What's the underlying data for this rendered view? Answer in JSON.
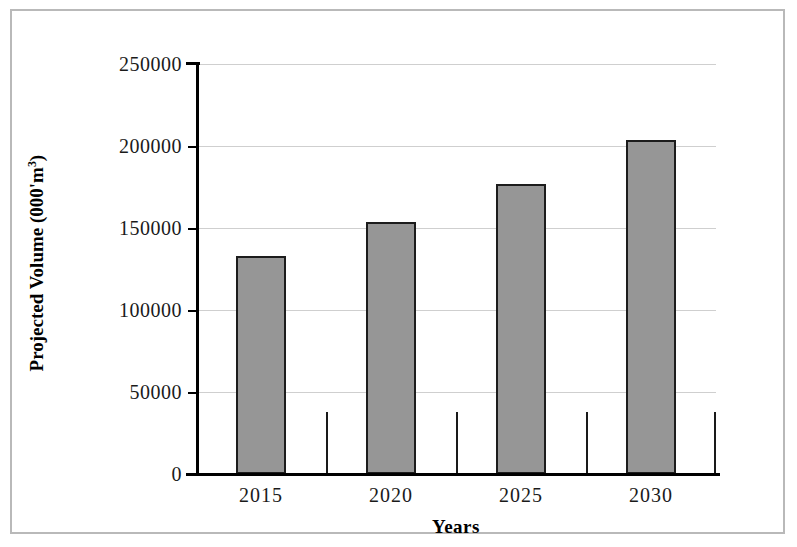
{
  "chart_data": {
    "type": "bar",
    "title": "",
    "categories": [
      "2015",
      "2020",
      "2025",
      "2030"
    ],
    "values": [
      133000,
      153500,
      177000,
      203500
    ],
    "series": [
      {
        "name": "Projected Volume",
        "values": [
          133000,
          153500,
          177000,
          203500
        ]
      }
    ],
    "xlabel": "Years",
    "ylabel": "Projected Volume (000'm3)",
    "ylabel_prefix": "Projected Volume (000'm",
    "ylabel_superscript": "3",
    "ylabel_suffix": ")",
    "ylim": [
      0,
      250000
    ],
    "ytick_values": [
      0,
      50000,
      100000,
      150000,
      200000,
      250000
    ],
    "ytick_labels": [
      "0",
      "50000",
      "100000",
      "150000",
      "200000",
      "250000"
    ],
    "grid": true,
    "legend": false,
    "bar_color": "#969696",
    "bar_edge_color": "#1c1c1c",
    "gridline_color": "#cfcfcf",
    "axis_color": "#000000",
    "background_color": "#ffffff"
  }
}
